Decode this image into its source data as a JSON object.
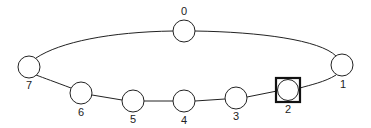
{
  "diagram": {
    "type": "ring-topology",
    "selected_node": "2",
    "nodes": [
      {
        "id": "0",
        "label": "0",
        "x": 184,
        "y": 31,
        "label_x": 184,
        "label_y": 7
      },
      {
        "id": "1",
        "label": "1",
        "x": 342,
        "y": 65,
        "label_x": 342,
        "label_y": 80
      },
      {
        "id": "2",
        "label": "2",
        "x": 288,
        "y": 90,
        "label_x": 288,
        "label_y": 104
      },
      {
        "id": "3",
        "label": "3",
        "x": 236,
        "y": 98,
        "label_x": 236,
        "label_y": 112
      },
      {
        "id": "4",
        "label": "4",
        "x": 184,
        "y": 101,
        "label_x": 184,
        "label_y": 116
      },
      {
        "id": "5",
        "label": "5",
        "x": 133,
        "y": 101,
        "label_x": 133,
        "label_y": 115
      },
      {
        "id": "6",
        "label": "6",
        "x": 81,
        "y": 93,
        "label_x": 81,
        "label_y": 107
      },
      {
        "id": "7",
        "label": "7",
        "x": 29,
        "y": 67,
        "label_x": 29,
        "label_y": 81
      }
    ],
    "edges": [
      [
        "0",
        "1"
      ],
      [
        "1",
        "2"
      ],
      [
        "2",
        "3"
      ],
      [
        "3",
        "4"
      ],
      [
        "4",
        "5"
      ],
      [
        "5",
        "6"
      ],
      [
        "6",
        "7"
      ],
      [
        "7",
        "0"
      ]
    ]
  }
}
